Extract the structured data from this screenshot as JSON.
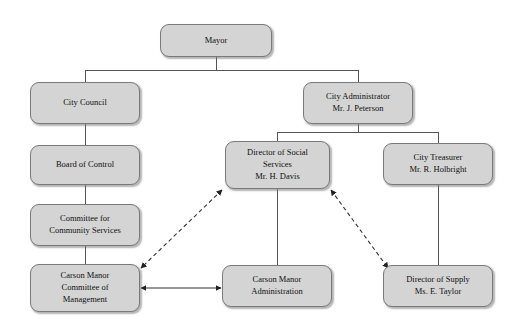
{
  "chart_data": {
    "type": "diagram",
    "diagram_kind": "organizational-chart",
    "node_style": {
      "fill": "#d4d4d4",
      "border": "#7a7a7a",
      "text": "#111111",
      "shape": "rounded-rectangle"
    },
    "edge_style": {
      "hierarchy_line": "#555555",
      "relationship_line": "#333333",
      "relationship_dash": "4,3"
    },
    "nodes": [
      {
        "id": "mayor",
        "label": "Mayor",
        "x": 160,
        "y": 24,
        "w": 112,
        "h": 33
      },
      {
        "id": "city-council",
        "label": "City Council",
        "x": 30,
        "y": 82,
        "w": 110,
        "h": 42
      },
      {
        "id": "city-administrator",
        "label": "City Administrator\nMr. J. Peterson",
        "x": 303,
        "y": 82,
        "w": 110,
        "h": 42
      },
      {
        "id": "board-of-control",
        "label": "Board of Control",
        "x": 30,
        "y": 145,
        "w": 110,
        "h": 40
      },
      {
        "id": "director-social-services",
        "label": "Director of Social\nServices\nMr. H. Davis",
        "x": 225,
        "y": 141,
        "w": 105,
        "h": 48
      },
      {
        "id": "city-treasurer",
        "label": "City Treasurer\nMr. R. Holbright",
        "x": 383,
        "y": 143,
        "w": 110,
        "h": 42
      },
      {
        "id": "committee-community-services",
        "label": "Committee for\nCommunity Services",
        "x": 30,
        "y": 204,
        "w": 110,
        "h": 42
      },
      {
        "id": "carson-manor-committee",
        "label": "Carson Manor\nCommittee of\nManagement",
        "x": 30,
        "y": 264,
        "w": 110,
        "h": 48
      },
      {
        "id": "carson-manor-administration",
        "label": "Carson Manor\nAdministration",
        "x": 222,
        "y": 265,
        "w": 110,
        "h": 42
      },
      {
        "id": "director-of-supply",
        "label": "Director of Supply\nMs. E. Taylor",
        "x": 383,
        "y": 265,
        "w": 110,
        "h": 42
      }
    ],
    "hierarchy_edges": [
      {
        "from": "mayor",
        "to": "city-council",
        "kind": "solid"
      },
      {
        "from": "mayor",
        "to": "city-administrator",
        "kind": "solid"
      },
      {
        "from": "city-council",
        "to": "board-of-control",
        "kind": "solid"
      },
      {
        "from": "board-of-control",
        "to": "committee-community-services",
        "kind": "solid"
      },
      {
        "from": "committee-community-services",
        "to": "carson-manor-committee",
        "kind": "solid"
      },
      {
        "from": "city-administrator",
        "to": "director-social-services",
        "kind": "solid"
      },
      {
        "from": "city-administrator",
        "to": "city-treasurer",
        "kind": "solid"
      },
      {
        "from": "director-social-services",
        "to": "carson-manor-administration",
        "kind": "solid"
      },
      {
        "from": "city-treasurer",
        "to": "director-of-supply",
        "kind": "solid"
      }
    ],
    "relationship_edges": [
      {
        "from": "director-social-services",
        "to": "carson-manor-committee",
        "kind": "dashed",
        "arrows": "both"
      },
      {
        "from": "director-social-services",
        "to": "director-of-supply",
        "kind": "dashed",
        "arrows": "both"
      },
      {
        "from": "carson-manor-committee",
        "to": "carson-manor-administration",
        "kind": "solid",
        "arrows": "both"
      }
    ]
  }
}
